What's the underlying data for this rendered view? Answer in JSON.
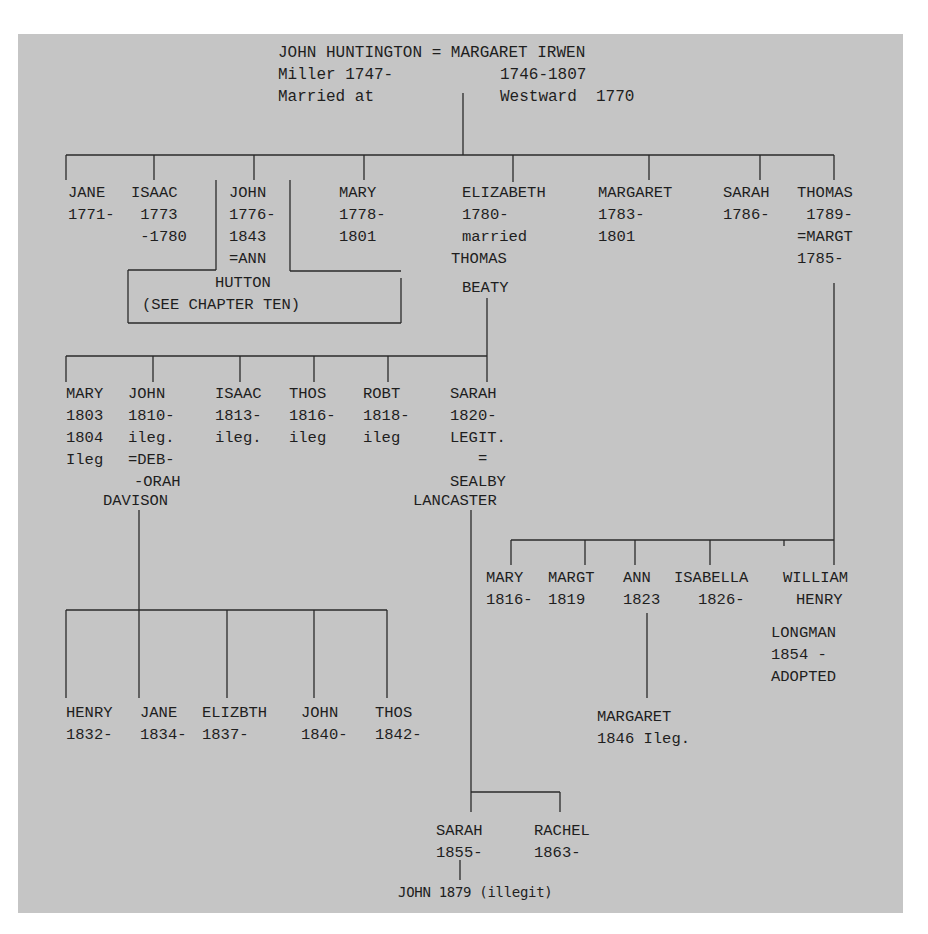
{
  "diagram": {
    "type": "family-tree",
    "line_color": "#2a2a2a",
    "background": "#c5c5c5",
    "root": {
      "couple": "JOHN HUNTINGTON = MARGARET IRWEN",
      "husband_notes": [
        "Miller 1747-",
        "Married at"
      ],
      "wife_notes": [
        "1746-1807",
        "Westward  1770"
      ]
    },
    "generation1": [
      {
        "name": "JANE",
        "lines": [
          "1771-"
        ]
      },
      {
        "name": "ISAAC",
        "lines": [
          " 1773",
          " -1780"
        ]
      },
      {
        "name": "JOHN",
        "lines": [
          "1776-",
          "1843",
          "=ANN"
        ]
      },
      {
        "name": "MARY",
        "lines": [
          "1778-",
          "1801"
        ]
      },
      {
        "name": "ELIZABETH",
        "lines": [
          "1780-",
          "married",
          "THOMAS",
          "BEATY"
        ]
      },
      {
        "name": "MARGARET",
        "lines": [
          "1783-",
          "1801"
        ]
      },
      {
        "name": "SARAH",
        "lines": [
          "1786-"
        ]
      },
      {
        "name": "THOMAS",
        "lines": [
          " 1789-",
          "=MARGT",
          "1785-"
        ]
      }
    ],
    "hutton_box": {
      "line1": "HUTTON",
      "line2": "(SEE CHAPTER TEN)"
    },
    "beaty_children": [
      {
        "name": "MARY",
        "lines": [
          "1803",
          "1804",
          "Ileg"
        ]
      },
      {
        "name": "JOHN",
        "lines": [
          "1810-",
          "ileg.",
          "=DEB-",
          "-ORAH",
          "DAVISON"
        ]
      },
      {
        "name": "ISAAC",
        "lines": [
          "1813-",
          "ileg."
        ]
      },
      {
        "name": "THOS",
        "lines": [
          "1816-",
          "ileg"
        ]
      },
      {
        "name": "ROBT",
        "lines": [
          "1818-",
          "ileg"
        ]
      },
      {
        "name": "SARAH",
        "lines": [
          "1820-",
          "LEGIT.",
          "=",
          "SEALBY",
          "LANCASTER"
        ]
      }
    ],
    "thomas_children": [
      {
        "name": "MARY",
        "lines": [
          "1816-"
        ]
      },
      {
        "name": "MARGT",
        "lines": [
          "1819"
        ]
      },
      {
        "name": "ANN",
        "lines": [
          "1823"
        ]
      },
      {
        "name": "ISABELLA",
        "lines": [
          "1826-"
        ]
      },
      {
        "name": "WILLIAM",
        "lines": [
          "HENRY",
          "LONGMAN",
          "1854 -",
          "ADOPTED"
        ]
      }
    ],
    "john_davison_children": [
      {
        "name": "HENRY",
        "lines": [
          "1832-"
        ]
      },
      {
        "name": "JANE",
        "lines": [
          "1834-"
        ]
      },
      {
        "name": "ELIZBTH",
        "lines": [
          "1837-"
        ]
      },
      {
        "name": "JOHN",
        "lines": [
          "1840-"
        ]
      },
      {
        "name": "THOS",
        "lines": [
          "1842-"
        ]
      }
    ],
    "ann_child": {
      "name": "MARGARET",
      "lines": [
        "1846 Ileg."
      ]
    },
    "sarah_lancaster_children": [
      {
        "name": "SARAH",
        "lines": [
          "1855-"
        ]
      },
      {
        "name": "RACHEL",
        "lines": [
          "1863-"
        ]
      }
    ],
    "sarah_child": {
      "name": "JOHN 1879 (illegit)"
    }
  }
}
